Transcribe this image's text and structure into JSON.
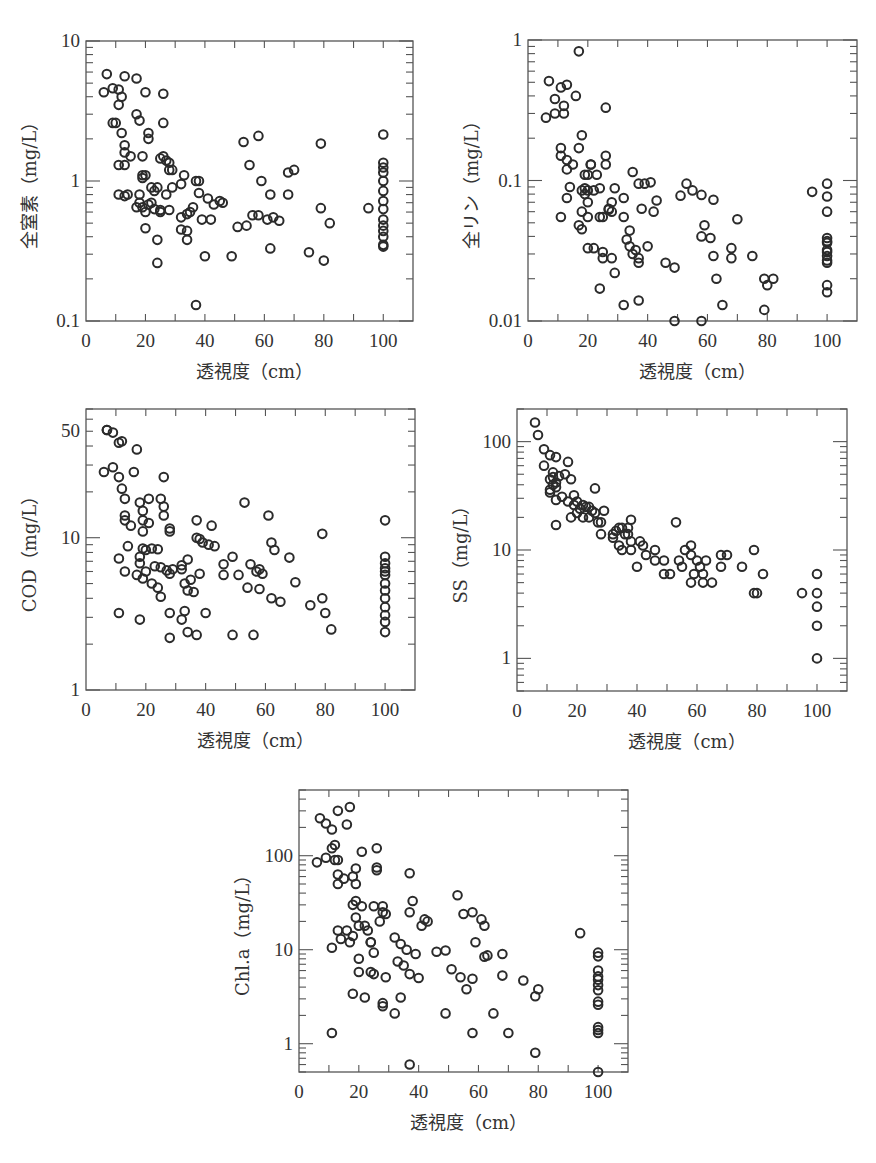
{
  "figure": {
    "panels": 5
  },
  "chart_data": [
    {
      "id": "tn",
      "type": "scatter",
      "title": "",
      "xlabel": "透視度（cm）",
      "ylabel": "全窒素（mg/L）",
      "xscale": "linear",
      "yscale": "log",
      "xlim": [
        0,
        110
      ],
      "ylim": [
        0.1,
        10
      ],
      "xticks": [
        0,
        20,
        40,
        60,
        80,
        100
      ],
      "xtick_labels": [
        "0",
        "20",
        "40",
        "60",
        "80",
        "100"
      ],
      "yticks": [
        0.1,
        1,
        10
      ],
      "ytick_labels": [
        "0.1",
        "1",
        "10"
      ],
      "grid": false,
      "legend": null,
      "x": [
        7,
        6,
        9,
        11,
        12,
        11,
        10,
        13,
        17,
        20,
        26,
        9,
        17,
        18,
        12,
        26,
        21,
        21,
        13,
        13,
        15,
        11,
        13,
        19,
        25,
        27,
        26,
        28,
        28,
        29,
        19,
        20,
        19,
        22,
        24,
        23,
        11,
        13,
        14,
        18,
        18,
        19,
        17,
        21,
        20,
        22,
        23,
        25,
        28,
        24,
        27,
        29,
        32,
        33,
        32,
        35,
        34,
        37,
        38,
        38,
        39,
        36,
        41,
        43,
        42,
        46,
        45,
        32,
        34,
        34,
        40,
        37,
        49,
        51,
        53,
        55,
        54,
        56,
        58,
        58,
        59,
        61,
        62,
        63,
        65,
        62,
        68,
        68,
        70,
        75,
        79,
        79,
        80,
        82,
        95,
        100,
        100,
        100,
        100,
        100,
        100,
        100,
        100,
        100,
        100,
        100,
        100,
        100,
        100,
        24,
        25,
        20
      ],
      "y": [
        5.8,
        4.3,
        4.6,
        4.5,
        4.0,
        3.5,
        2.6,
        5.6,
        5.4,
        4.3,
        4.2,
        2.6,
        3.0,
        2.7,
        2.2,
        2.6,
        2.2,
        2.0,
        1.8,
        1.6,
        1.5,
        1.3,
        1.3,
        1.5,
        1.45,
        1.4,
        1.5,
        1.35,
        1.2,
        1.2,
        1.1,
        1.1,
        1.05,
        0.9,
        0.9,
        0.85,
        0.8,
        0.78,
        0.8,
        0.8,
        0.7,
        0.65,
        0.65,
        0.68,
        0.6,
        0.7,
        0.63,
        0.6,
        0.62,
        0.38,
        0.8,
        0.9,
        0.95,
        1.1,
        0.55,
        0.6,
        0.58,
        1.0,
        1.0,
        0.82,
        0.53,
        0.65,
        0.75,
        0.68,
        0.53,
        0.7,
        0.72,
        0.45,
        0.44,
        0.38,
        0.29,
        0.13,
        0.29,
        0.47,
        1.9,
        1.3,
        0.48,
        0.57,
        2.1,
        0.57,
        1.0,
        0.53,
        0.8,
        0.55,
        0.52,
        0.33,
        0.8,
        1.15,
        1.2,
        0.31,
        1.85,
        0.64,
        0.27,
        0.5,
        0.64,
        2.15,
        1.35,
        1.25,
        1.15,
        1.0,
        0.85,
        0.72,
        0.63,
        0.53,
        0.48,
        0.44,
        0.4,
        0.35,
        0.34,
        0.26,
        0.62,
        0.46
      ]
    },
    {
      "id": "tp",
      "type": "scatter",
      "title": "",
      "xlabel": "透視度（cm）",
      "ylabel": "全リン（mg/L）",
      "xscale": "linear",
      "yscale": "log",
      "xlim": [
        0,
        110
      ],
      "ylim": [
        0.01,
        1
      ],
      "xticks": [
        0,
        20,
        40,
        60,
        80,
        100
      ],
      "xtick_labels": [
        "0",
        "20",
        "40",
        "60",
        "80",
        "100"
      ],
      "yticks": [
        0.01,
        0.1,
        1
      ],
      "ytick_labels": [
        "0.01",
        "0.1",
        "1"
      ],
      "grid": false,
      "legend": null,
      "x": [
        17,
        7,
        11,
        13,
        9,
        12,
        12,
        9,
        6,
        16,
        26,
        18,
        17,
        11,
        11,
        13,
        15,
        13,
        26,
        26,
        21,
        21,
        19,
        20,
        23,
        18,
        19,
        22,
        24,
        20,
        19,
        13,
        14,
        20,
        18,
        17,
        18,
        11,
        20,
        24,
        25,
        29,
        28,
        27,
        28,
        27,
        35,
        37,
        39,
        41,
        38,
        42,
        43,
        32,
        32,
        34,
        33,
        36,
        34,
        37,
        35,
        37,
        40,
        46,
        49,
        53,
        51,
        55,
        58,
        62,
        59,
        58,
        61,
        62,
        63,
        65,
        68,
        68,
        70,
        75,
        79,
        80,
        82,
        79,
        95,
        100,
        100,
        100,
        100,
        100,
        100,
        100,
        100,
        100,
        100,
        100,
        100,
        100,
        25,
        25,
        28,
        29,
        24,
        32,
        37,
        49,
        58,
        22,
        20
      ],
      "y": [
        0.83,
        0.51,
        0.46,
        0.48,
        0.38,
        0.34,
        0.3,
        0.3,
        0.28,
        0.4,
        0.33,
        0.21,
        0.17,
        0.17,
        0.15,
        0.14,
        0.13,
        0.12,
        0.15,
        0.13,
        0.13,
        0.13,
        0.11,
        0.11,
        0.11,
        0.085,
        0.088,
        0.085,
        0.088,
        0.085,
        0.08,
        0.075,
        0.09,
        0.07,
        0.06,
        0.048,
        0.045,
        0.055,
        0.055,
        0.055,
        0.055,
        0.088,
        0.07,
        0.063,
        0.06,
        0.062,
        0.115,
        0.095,
        0.095,
        0.097,
        0.063,
        0.06,
        0.072,
        0.075,
        0.055,
        0.044,
        0.038,
        0.032,
        0.034,
        0.026,
        0.03,
        0.028,
        0.034,
        0.026,
        0.024,
        0.095,
        0.078,
        0.085,
        0.079,
        0.073,
        0.048,
        0.04,
        0.039,
        0.029,
        0.02,
        0.013,
        0.028,
        0.033,
        0.053,
        0.029,
        0.012,
        0.018,
        0.02,
        0.02,
        0.083,
        0.095,
        0.077,
        0.06,
        0.039,
        0.037,
        0.036,
        0.032,
        0.031,
        0.029,
        0.027,
        0.026,
        0.018,
        0.016,
        0.031,
        0.028,
        0.028,
        0.022,
        0.017,
        0.013,
        0.014,
        0.01,
        0.01,
        0.033,
        0.033
      ]
    },
    {
      "id": "cod",
      "type": "scatter",
      "title": "",
      "xlabel": "透視度（cm）",
      "ylabel": "COD（mg/L）",
      "xscale": "linear",
      "yscale": "log",
      "xlim": [
        0,
        110
      ],
      "ylim": [
        1,
        70
      ],
      "xticks": [
        0,
        20,
        40,
        60,
        80,
        100
      ],
      "xtick_labels": [
        "0",
        "20",
        "40",
        "60",
        "80",
        "100"
      ],
      "yticks": [
        1,
        10,
        50
      ],
      "ytick_labels": [
        "1",
        "10",
        "50"
      ],
      "grid": false,
      "legend": null,
      "x": [
        7,
        7,
        9,
        11,
        12,
        17,
        9,
        6,
        16,
        11,
        26,
        12,
        13,
        18,
        21,
        25,
        26,
        26,
        19,
        13,
        13,
        15,
        19,
        21,
        28,
        28,
        19,
        37,
        42,
        38,
        37,
        39,
        41,
        43,
        14,
        19,
        20,
        22,
        24,
        18,
        11,
        23,
        25,
        27,
        29,
        18,
        28,
        13,
        17,
        19,
        20,
        22,
        24,
        25,
        32,
        32,
        34,
        33,
        35,
        34,
        36,
        38,
        46,
        46,
        49,
        51,
        53,
        55,
        57,
        58,
        59,
        61,
        62,
        63,
        54,
        58,
        62,
        65,
        68,
        70,
        75,
        79,
        79,
        80,
        82,
        100,
        100,
        100,
        100,
        100,
        100,
        100,
        100,
        100,
        100,
        100,
        100,
        100,
        11,
        18,
        28,
        32,
        33,
        34,
        37,
        40,
        49,
        56,
        28
      ],
      "y": [
        51,
        51,
        49,
        42,
        43,
        38,
        29,
        27,
        27,
        25,
        25,
        21,
        18,
        17,
        18,
        18,
        16,
        14,
        15,
        14,
        13,
        12,
        13,
        12.5,
        11.5,
        11,
        11,
        13,
        12,
        9.8,
        10,
        9.3,
        9,
        8.8,
        8.8,
        8.5,
        8.3,
        8.5,
        8.4,
        7.5,
        7.3,
        6.5,
        6.4,
        6.1,
        6.2,
        6.8,
        5.8,
        6,
        5.7,
        5.4,
        6,
        5,
        4.7,
        4.1,
        6.6,
        6.2,
        7.2,
        5,
        5.3,
        4.5,
        4.4,
        5.8,
        6.7,
        5.7,
        7.5,
        5.7,
        17,
        6.7,
        6,
        6.2,
        5.8,
        14,
        9.3,
        8.3,
        4.7,
        4.6,
        4,
        3.8,
        7.4,
        5.1,
        3.6,
        4,
        10.6,
        3.2,
        2.5,
        13,
        7.5,
        6.8,
        6.3,
        6,
        5.7,
        5,
        4.5,
        4,
        3.5,
        3.1,
        2.8,
        2.4,
        3.2,
        2.9,
        3.2,
        2.9,
        3.3,
        2.4,
        2.3,
        3.2,
        2.3,
        2.3,
        2.2
      ]
    },
    {
      "id": "ss",
      "type": "scatter",
      "title": "",
      "xlabel": "透視度（cm）",
      "ylabel": "SS（mg/L）",
      "xscale": "linear",
      "yscale": "log",
      "xlim": [
        0,
        110
      ],
      "ylim": [
        0.5,
        200
      ],
      "xticks": [
        0,
        20,
        40,
        60,
        80,
        100
      ],
      "xtick_labels": [
        "0",
        "20",
        "40",
        "60",
        "80",
        "100"
      ],
      "yticks": [
        1,
        10,
        100
      ],
      "ytick_labels": [
        "1",
        "10",
        "100"
      ],
      "grid": false,
      "legend": null,
      "x": [
        6,
        7,
        9,
        9,
        11,
        13,
        17,
        12,
        16,
        18,
        11,
        12,
        14,
        13,
        11,
        11,
        13,
        15,
        17,
        19,
        20,
        13,
        12,
        26,
        22,
        23,
        24,
        19,
        21,
        25,
        18,
        20,
        22,
        24,
        26,
        28,
        27,
        29,
        28,
        13,
        32,
        34,
        33,
        35,
        37,
        38,
        36,
        37,
        32,
        34,
        35,
        38,
        38,
        40,
        41,
        42,
        43,
        46,
        46,
        49,
        49,
        51,
        53,
        54,
        55,
        56,
        58,
        58,
        59,
        60,
        61,
        62,
        63,
        58,
        62,
        65,
        68,
        68,
        70,
        75,
        79,
        79,
        80,
        82,
        95,
        100,
        100,
        100,
        100,
        100
      ],
      "y": [
        150,
        115,
        85,
        60,
        75,
        72,
        65,
        52,
        50,
        45,
        45,
        47,
        48,
        38,
        34,
        36,
        29,
        31,
        28,
        32,
        28,
        42,
        40,
        37,
        26,
        25,
        25,
        26,
        24,
        23,
        20,
        22,
        20,
        20,
        22,
        18,
        18,
        23,
        14,
        17,
        14,
        16,
        15,
        16,
        16,
        19,
        14,
        14,
        13,
        11,
        10,
        10,
        12,
        7,
        12,
        11,
        9,
        10,
        8,
        8,
        6,
        6,
        18,
        8,
        7,
        10,
        11,
        9,
        6,
        8,
        7,
        6,
        8,
        5,
        5,
        5,
        9,
        7,
        9,
        7,
        10,
        4,
        4,
        6,
        4,
        6,
        4,
        3,
        2,
        1
      ]
    },
    {
      "id": "chla",
      "type": "scatter",
      "title": "",
      "xlabel": "透視度（cm）",
      "ylabel": "Chl.a（mg/L）",
      "xscale": "linear",
      "yscale": "log",
      "xlim": [
        0,
        110
      ],
      "ylim": [
        0.5,
        500
      ],
      "xticks": [
        0,
        20,
        40,
        60,
        80,
        100
      ],
      "xtick_labels": [
        "0",
        "20",
        "40",
        "60",
        "80",
        "100"
      ],
      "yticks": [
        1,
        10,
        100
      ],
      "ytick_labels": [
        "1",
        "10",
        "100"
      ],
      "grid": false,
      "legend": null,
      "x": [
        17,
        13,
        7,
        9,
        16,
        11,
        12,
        11,
        26,
        21,
        9,
        6,
        12,
        13,
        19,
        26,
        26,
        37,
        13,
        15,
        18,
        19,
        13,
        19,
        18,
        21,
        25,
        28,
        29,
        38,
        28,
        27,
        37,
        42,
        43,
        19,
        20,
        41,
        22,
        23,
        16,
        13,
        14,
        17,
        24,
        24,
        18,
        53,
        55,
        58,
        61,
        62,
        94,
        59,
        11,
        25,
        46,
        49,
        39,
        36,
        32,
        34,
        33,
        35,
        37,
        20,
        24,
        25,
        20,
        29,
        51,
        54,
        58,
        56,
        62,
        63,
        68,
        68,
        75,
        80,
        79,
        40,
        18,
        22,
        28,
        28,
        32,
        34,
        49,
        65,
        58,
        70,
        11,
        79,
        37,
        100,
        100,
        100,
        100,
        100,
        100,
        100,
        100,
        100,
        100,
        100,
        100,
        100
      ],
      "y": [
        330,
        300,
        250,
        220,
        215,
        190,
        130,
        120,
        120,
        110,
        95,
        85,
        90,
        90,
        73,
        75,
        70,
        65,
        63,
        57,
        60,
        50,
        50,
        33,
        30,
        29,
        29,
        29,
        24,
        33,
        25,
        20,
        25,
        21,
        20,
        22,
        18,
        18,
        18,
        16,
        16,
        16,
        13,
        12,
        12,
        12,
        14,
        38,
        24,
        25,
        21,
        18,
        15,
        12,
        10.5,
        9.3,
        9.5,
        9.8,
        9,
        10,
        13.5,
        11.5,
        7.5,
        6.8,
        5.5,
        8,
        5.8,
        5.5,
        5.8,
        5.1,
        6.2,
        5.1,
        4.9,
        3.8,
        8.4,
        8.7,
        9,
        5.3,
        4.7,
        3.8,
        3.2,
        5,
        3.4,
        3.1,
        2.7,
        2.5,
        2.1,
        3.1,
        2.1,
        2.1,
        1.3,
        1.3,
        1.3,
        0.8,
        0.6,
        9.3,
        8.5,
        6,
        5.2,
        4.8,
        4.2,
        3.7,
        2.8,
        2.6,
        1.5,
        1.4,
        1.3,
        0.5
      ]
    }
  ]
}
